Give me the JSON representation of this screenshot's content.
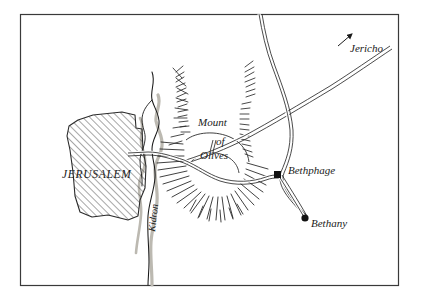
{
  "map": {
    "title_visible": false,
    "frame": {
      "x": 20,
      "y": 14,
      "width": 378,
      "height": 271,
      "stroke": "#3a3a3a"
    },
    "background_color": "#ffffff",
    "ink_color": "#1a1a1a",
    "valley_shadow_color": "#b8b5ad",
    "labels": [
      {
        "id": "jerusalem",
        "text": "JERUSALEM",
        "x": 62,
        "y": 178,
        "style": "city",
        "rotate": 0
      },
      {
        "id": "mount",
        "text": "Mount",
        "x": 198,
        "y": 126,
        "style": "mount",
        "rotate": 0
      },
      {
        "id": "of",
        "text": "of",
        "x": 216,
        "y": 145,
        "style": "mount",
        "rotate": 0
      },
      {
        "id": "olives",
        "text": "Olives",
        "x": 200,
        "y": 159,
        "style": "mount",
        "rotate": 0
      },
      {
        "id": "bethphage",
        "text": "Bethphage",
        "x": 288,
        "y": 174,
        "style": "place",
        "rotate": 0
      },
      {
        "id": "bethany",
        "text": "Bethany",
        "x": 311,
        "y": 227,
        "style": "place",
        "rotate": 0
      },
      {
        "id": "jericho",
        "text": "Jericho",
        "x": 350,
        "y": 52,
        "style": "place",
        "rotate": 0
      },
      {
        "id": "kidron",
        "text": "Kidron",
        "x": 155,
        "y": 232,
        "style": "river",
        "rotate": -84
      }
    ],
    "settlements": [
      {
        "id": "jerusalem",
        "name": "JERUSALEM",
        "marker": "hatched-area"
      },
      {
        "id": "bethphage",
        "name": "Bethphage",
        "marker": "square",
        "x": 277,
        "y": 175
      },
      {
        "id": "bethany",
        "name": "Bethany",
        "marker": "circle",
        "x": 305,
        "y": 218
      },
      {
        "id": "mount-of-olives",
        "name": "Mount of Olives",
        "marker": "hachure-ridge"
      }
    ],
    "roads": [
      {
        "id": "jericho-road",
        "name": "Road to Jericho",
        "type": "double-line",
        "destination": "Jericho",
        "has_arrow": true
      },
      {
        "id": "bethphage-road",
        "name": "Road to Bethphage",
        "type": "double-line"
      },
      {
        "id": "bethany-road",
        "name": "Road to Bethany",
        "type": "double-line"
      },
      {
        "id": "north-south-road",
        "name": "North-south road",
        "type": "double-line"
      }
    ],
    "waterways": [
      {
        "id": "kidron",
        "name": "Kidron",
        "type": "valley-stream"
      }
    ],
    "terrain": [
      {
        "id": "olives-ridge",
        "name": "Mount of Olives ridge",
        "type": "radial-hachure"
      },
      {
        "id": "north-ridge",
        "name": "Northern ridge",
        "type": "linear-hachure"
      },
      {
        "id": "east-ridge",
        "name": "Eastern ridge",
        "type": "linear-hachure"
      }
    ]
  }
}
